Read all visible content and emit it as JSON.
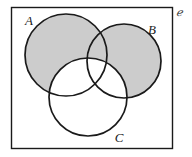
{
  "figure": {
    "kind": "venn-diagram",
    "set_count": 3,
    "shaded_description": "(A union B) minus C",
    "background_color": "#ffffff",
    "shade_color": "#cccccc",
    "stroke_color": "#1a1a1a",
    "universe": {
      "label": "ℯ",
      "label_name": "universal-set-symbol",
      "box": {
        "x": 11,
        "y": 7,
        "width": 161,
        "height": 141
      }
    },
    "sets": [
      {
        "id": "A",
        "label": "A",
        "cx": 66,
        "cy": 55,
        "r": 41,
        "label_x": 29,
        "label_y": 25
      },
      {
        "id": "B",
        "label": "B",
        "cx": 124,
        "cy": 61,
        "r": 37,
        "label_x": 152,
        "label_y": 34
      },
      {
        "id": "C",
        "label": "C",
        "cx": 88,
        "cy": 97,
        "r": 39,
        "label_x": 119,
        "label_y": 142
      }
    ]
  }
}
